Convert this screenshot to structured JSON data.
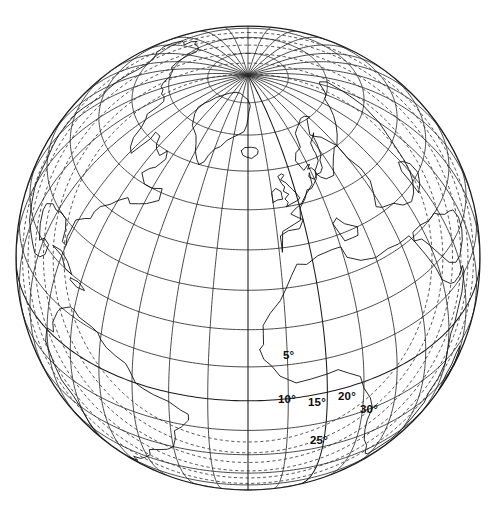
{
  "figure": {
    "kind": "orthographic-globe-map",
    "width": 497,
    "height": 511,
    "background_color": "#ffffff",
    "line_color": "#1a1a1a"
  },
  "globe": {
    "center_x": 248,
    "center_y": 258,
    "radius": 232,
    "projection": "orthographic",
    "center_longitude_deg": -20,
    "center_latitude_deg": 38,
    "graticule_step_deg": 10,
    "limb_stroke_color": "#1a1a1a"
  },
  "chart_data": {
    "type": "line",
    "title": "",
    "xlabel": "",
    "ylabel": "",
    "projection": "orthographic",
    "grid": true,
    "legend_position": "none",
    "graticule": {
      "parallels_deg": [
        -80,
        -70,
        -60,
        -50,
        -40,
        -30,
        -20,
        -10,
        0,
        10,
        20,
        30,
        40,
        50,
        60,
        70,
        80
      ],
      "meridians_deg": [
        -180,
        -170,
        -160,
        -150,
        -140,
        -130,
        -120,
        -110,
        -100,
        -90,
        -80,
        -70,
        -60,
        -50,
        -40,
        -30,
        -20,
        -10,
        0,
        10,
        20,
        30,
        40,
        50,
        60,
        70,
        80,
        90,
        100,
        110,
        120,
        130,
        140,
        150,
        160,
        170
      ],
      "interval_deg": 10
    },
    "contours": {
      "style": "dashed",
      "unit": "degrees",
      "description": "elevation-angle contours",
      "levels": [
        5,
        10,
        15,
        20,
        25,
        30
      ]
    },
    "annotations": [
      {
        "id": "contour-label-5",
        "text": "5°",
        "value": 5,
        "x": 289,
        "y": 355,
        "rotation": 0
      },
      {
        "id": "contour-label-10",
        "text": "10°",
        "value": 10,
        "x": 288,
        "y": 399,
        "rotation": 0
      },
      {
        "id": "contour-label-15",
        "text": "15°",
        "value": 15,
        "x": 318,
        "y": 402,
        "rotation": 0
      },
      {
        "id": "contour-label-20",
        "text": "20°",
        "value": 20,
        "x": 347,
        "y": 396,
        "rotation": 0
      },
      {
        "id": "contour-label-30",
        "text": "30°",
        "value": 30,
        "x": 367,
        "y": 409,
        "rotation": 0
      },
      {
        "id": "contour-label-25",
        "text": "25°",
        "value": 25,
        "x": 317,
        "y": 440,
        "rotation": 0
      }
    ]
  },
  "labels": {
    "deg5": "5°",
    "deg10": "10°",
    "deg15": "15°",
    "deg20": "20°",
    "deg25": "25°",
    "deg30": "30°"
  }
}
